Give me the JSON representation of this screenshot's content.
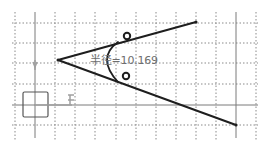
{
  "sketch": {
    "dimension_label": "半径=10.169",
    "dimension_type": "radius",
    "dimension_value": "10.169",
    "colors": {
      "background": "#ffffff",
      "grid": "#8a8a8a",
      "axis": "#7a7a7a",
      "geometry": "#1e1e1e",
      "dimension_text": "#6e6e6e"
    },
    "axis_labels": {
      "h_marker": "H",
      "v_marker": "V"
    }
  }
}
